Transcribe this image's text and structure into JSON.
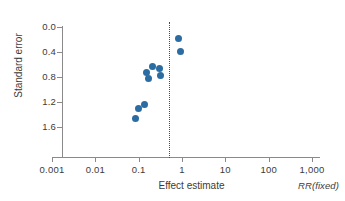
{
  "chart_data": {
    "type": "scatter",
    "title": "",
    "xlabel": "Effect estimate",
    "ylabel": "Standard error",
    "annotation": "RR(fixed)",
    "xscale": "log",
    "xlim": [
      0.001,
      1000
    ],
    "ylim": [
      0.0,
      1.8
    ],
    "y_inverted": true,
    "grid": false,
    "legend": null,
    "xticks": [
      {
        "value": 0.001,
        "label": "0.001"
      },
      {
        "value": 0.01,
        "label": "0.01"
      },
      {
        "value": 0.1,
        "label": "0.1"
      },
      {
        "value": 1,
        "label": "1"
      },
      {
        "value": 10,
        "label": "10"
      },
      {
        "value": 100,
        "label": "100"
      },
      {
        "value": 1000,
        "label": "1,000"
      }
    ],
    "yticks": [
      {
        "value": 0.0,
        "label": "0.0"
      },
      {
        "value": 0.4,
        "label": "0.4"
      },
      {
        "value": 0.8,
        "label": "0.8"
      },
      {
        "value": 1.2,
        "label": "1.2"
      },
      {
        "value": 1.6,
        "label": "1.6"
      }
    ],
    "reference_line": {
      "x": 0.5,
      "style": "dotted"
    },
    "marker_color": "#2b6ca3",
    "points": [
      {
        "x": 0.085,
        "y": 1.45
      },
      {
        "x": 0.098,
        "y": 1.3
      },
      {
        "x": 0.135,
        "y": 1.24
      },
      {
        "x": 0.15,
        "y": 0.72
      },
      {
        "x": 0.168,
        "y": 0.82
      },
      {
        "x": 0.21,
        "y": 0.63
      },
      {
        "x": 0.3,
        "y": 0.66
      },
      {
        "x": 0.32,
        "y": 0.77
      },
      {
        "x": 0.84,
        "y": 0.19
      },
      {
        "x": 0.9,
        "y": 0.39
      }
    ]
  },
  "axes": {
    "x_title": "Effect estimate",
    "y_title": "Standard error",
    "note": "RR(fixed)"
  },
  "colors": {
    "marker": "#2b6ca3",
    "axis": "#8a8a8a",
    "text": "#3b3b3b"
  }
}
